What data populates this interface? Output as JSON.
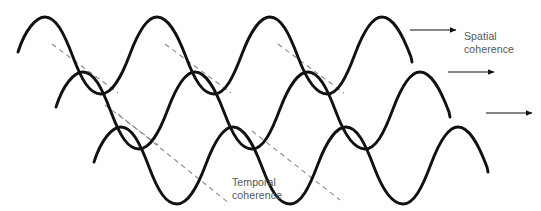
{
  "figure": {
    "type": "wave-diagram",
    "width": 541,
    "height": 211,
    "background_color": "#ffffff",
    "wave_color": "#111111",
    "wave_stroke_width": 2.8,
    "dashed_color": "#8a8a8a",
    "dashed_stroke_width": 1.1,
    "dash_pattern": "5,4",
    "arrow_color": "#111111",
    "text_color": "#555555"
  },
  "labels": {
    "spatial": "Spatial\ncoherence",
    "temporal": "Temporal\ncoherence"
  },
  "waves": [
    {
      "name": "wave-top",
      "start_x": 18,
      "baseline_y": 52,
      "amplitude": 35,
      "period": 112.5,
      "cycles": 3.5,
      "crests_x": [
        45,
        157,
        270,
        382
      ],
      "end_x": 412
    },
    {
      "name": "wave-middle",
      "start_x": 56,
      "baseline_y": 107,
      "amplitude": 35,
      "period": 112.5,
      "cycles": 3.5,
      "crests_x": [
        83,
        195,
        308,
        420
      ],
      "end_x": 450
    },
    {
      "name": "wave-bottom",
      "start_x": 94,
      "baseline_y": 162,
      "amplitude": 35,
      "period": 112.5,
      "cycles": 3.5,
      "crests_x": [
        121,
        233,
        346,
        458
      ],
      "end_x": 488
    }
  ],
  "dashed_lines": [
    {
      "name": "spatial-dash-1",
      "x1": 52,
      "y1": 44,
      "x2": 118,
      "y2": 93
    },
    {
      "name": "spatial-dash-2",
      "x1": 165,
      "y1": 44,
      "x2": 231,
      "y2": 93
    },
    {
      "name": "spatial-dash-3",
      "x1": 278,
      "y1": 44,
      "x2": 344,
      "y2": 93
    },
    {
      "name": "temporal-dash-1",
      "x1": 90,
      "y1": 99,
      "x2": 228,
      "y2": 205
    },
    {
      "name": "temporal-dash-2",
      "x1": 252,
      "y1": 131,
      "x2": 340,
      "y2": 200
    },
    {
      "name": "temporal-dash-3",
      "x1": 105,
      "y1": 105,
      "x2": 155,
      "y2": 143
    }
  ],
  "arrows": [
    {
      "name": "arrow-top",
      "x1": 410,
      "y1": 30,
      "x2": 456,
      "y2": 30
    },
    {
      "name": "arrow-middle",
      "x1": 448,
      "y1": 72,
      "x2": 494,
      "y2": 72
    },
    {
      "name": "arrow-bottom",
      "x1": 486,
      "y1": 113,
      "x2": 532,
      "y2": 113
    }
  ]
}
